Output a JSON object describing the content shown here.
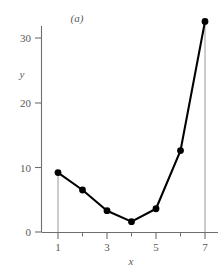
{
  "chart_data": {
    "type": "line",
    "title": "",
    "panel_label": "(a)",
    "xlabel": "x",
    "ylabel": "y",
    "x": [
      1,
      2,
      3,
      4,
      5,
      6,
      7
    ],
    "values": [
      9.2,
      6.5,
      3.3,
      1.6,
      3.6,
      12.6,
      32.6
    ],
    "series": [
      {
        "name": "series-1",
        "x": [
          1,
          2,
          3,
          4,
          5,
          6,
          7
        ],
        "values": [
          9.2,
          6.5,
          3.3,
          1.6,
          3.6,
          12.6,
          32.6
        ]
      }
    ],
    "xlim": [
      0.5,
      7.4
    ],
    "ylim": [
      0,
      33.5
    ],
    "x_ticks_major": [
      1,
      3,
      5,
      7
    ],
    "x_ticks_minor": [
      2,
      4,
      6
    ],
    "x_tick_labels": [
      "1",
      "3",
      "5",
      "7"
    ],
    "y_ticks_major": [
      0,
      10,
      20,
      30
    ],
    "y_tick_labels": [
      "0",
      "10",
      "20",
      "30"
    ],
    "grid": false,
    "legend": false,
    "legend_position": "none",
    "marker": "filled-circle",
    "line_color": "#000000",
    "marker_color": "#000000",
    "dropline_color": "#9a9a9a",
    "axis_color": "#6e6e6e",
    "background_color": "#ffffff",
    "droplines_at_x": [
      1,
      7
    ],
    "annotations": [
      {
        "text": "(a)",
        "x": 3.1,
        "y": 33.0
      }
    ]
  }
}
